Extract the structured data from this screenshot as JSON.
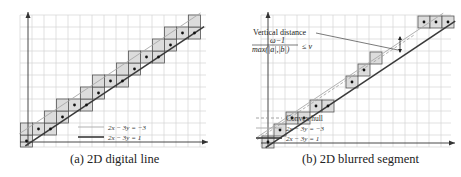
{
  "figure": {
    "panels": [
      {
        "id": "a",
        "caption": "(a) 2D digital line",
        "legend": [
          {
            "label": "2x − 3y = −3",
            "style": "thin-gray-solid"
          },
          {
            "label": "2x − 3y = 1",
            "style": "thick-dark-solid"
          }
        ],
        "pixels": [
          [
            0,
            0
          ],
          [
            0,
            1
          ],
          [
            1,
            1
          ],
          [
            2,
            1
          ],
          [
            2,
            2
          ],
          [
            3,
            2
          ],
          [
            3,
            3
          ],
          [
            4,
            3
          ],
          [
            5,
            3
          ],
          [
            5,
            4
          ],
          [
            6,
            4
          ],
          [
            6,
            5
          ],
          [
            7,
            5
          ],
          [
            8,
            5
          ],
          [
            8,
            6
          ],
          [
            9,
            6
          ],
          [
            9,
            7
          ],
          [
            10,
            7
          ],
          [
            11,
            7
          ],
          [
            11,
            8
          ],
          [
            12,
            8
          ],
          [
            12,
            9
          ],
          [
            13,
            9
          ],
          [
            14,
            9
          ],
          [
            14,
            10
          ]
        ],
        "dots": [
          [
            0,
            0
          ],
          [
            1,
            1
          ],
          [
            2,
            1
          ],
          [
            3,
            2
          ],
          [
            4,
            3
          ],
          [
            5,
            3
          ],
          [
            6,
            4
          ],
          [
            7,
            5
          ],
          [
            8,
            5
          ],
          [
            9,
            6
          ],
          [
            10,
            7
          ],
          [
            11,
            7
          ],
          [
            12,
            8
          ],
          [
            13,
            9
          ],
          [
            14,
            9
          ]
        ]
      },
      {
        "id": "b",
        "caption": "(b) 2D blurred segment",
        "annotation": {
          "title": "Vertical distance",
          "numerator": "ω−1",
          "denominator": "max(|a|,|b|)",
          "relation": "≤ ν"
        },
        "legend": [
          {
            "label": "Convex hull",
            "style": "dashed-gray"
          },
          {
            "label": "2x − 3y = −3",
            "style": "thin-gray-solid"
          },
          {
            "label": "2x − 3y = 1",
            "style": "thick-dark-solid"
          }
        ],
        "pixels": [
          [
            0,
            0
          ],
          [
            1,
            1
          ],
          [
            2,
            2
          ],
          [
            3,
            2
          ],
          [
            4,
            3
          ],
          [
            5,
            3
          ],
          [
            7,
            5
          ],
          [
            8,
            6
          ],
          [
            9,
            7
          ],
          [
            13,
            10
          ],
          [
            14,
            10
          ],
          [
            15,
            10
          ]
        ],
        "dots": [
          [
            0,
            0
          ],
          [
            1,
            1
          ],
          [
            2,
            2
          ],
          [
            3,
            2
          ],
          [
            4,
            3
          ],
          [
            5,
            3
          ],
          [
            7,
            5
          ],
          [
            8,
            6
          ],
          [
            13,
            10
          ],
          [
            14,
            10
          ],
          [
            15,
            10
          ]
        ]
      }
    ]
  },
  "colors": {
    "pixel_fill": "#dcdcdc",
    "pixel_stroke": "#555555",
    "grid": "#d4d4d4",
    "axis": "#333333",
    "upper_line": "#a8a8a8",
    "lower_line": "#3a3a3a"
  }
}
